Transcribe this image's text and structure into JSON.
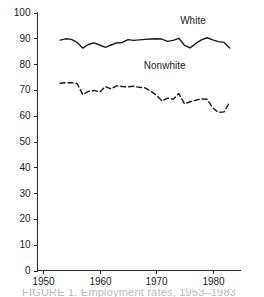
{
  "chart_data": {
    "type": "line",
    "title": "",
    "xlabel": "",
    "ylabel": "",
    "xlim": [
      1949,
      1985
    ],
    "ylim": [
      0,
      100
    ],
    "grid": false,
    "legend_position": "inline-labels",
    "xticks": [
      1950,
      1960,
      1970,
      1980
    ],
    "yticks": [
      0,
      10,
      20,
      30,
      40,
      50,
      60,
      70,
      80,
      90,
      100
    ],
    "x": [
      1953,
      1954,
      1955,
      1956,
      1957,
      1958,
      1959,
      1960,
      1961,
      1962,
      1963,
      1964,
      1965,
      1966,
      1967,
      1968,
      1969,
      1970,
      1971,
      1972,
      1973,
      1974,
      1975,
      1976,
      1977,
      1978,
      1979,
      1980,
      1981,
      1982,
      1983
    ],
    "series": [
      {
        "name": "White",
        "style": "solid",
        "values": [
          89.3,
          89.8,
          89.6,
          88.4,
          86.2,
          87.6,
          88.2,
          87.4,
          86.5,
          87.4,
          88.2,
          88.4,
          89.5,
          89.2,
          89.4,
          89.6,
          89.7,
          89.8,
          89.7,
          88.8,
          89.2,
          90.0,
          87.3,
          86.3,
          88.0,
          89.4,
          90.2,
          89.4,
          88.7,
          88.4,
          86.2
        ]
      },
      {
        "name": "Nonwhite",
        "style": "dashed",
        "values": [
          72.6,
          72.8,
          72.8,
          72.5,
          68.2,
          69.4,
          69.8,
          69.2,
          71.3,
          70.4,
          71.6,
          71.3,
          71.2,
          71.4,
          71.0,
          70.8,
          69.6,
          68.0,
          65.8,
          66.8,
          66.4,
          68.6,
          64.6,
          65.4,
          66.0,
          66.5,
          66.4,
          63.0,
          61.3,
          61.5,
          65.2
        ]
      }
    ],
    "annotations": [
      {
        "text": "White",
        "x": 1976.5,
        "y": 95.5
      },
      {
        "text": "Nonwhite",
        "x": 1971.5,
        "y": 78.0
      }
    ]
  },
  "caption": {
    "text": "FIGURE 1.  Employment rates, 1953–1983"
  }
}
